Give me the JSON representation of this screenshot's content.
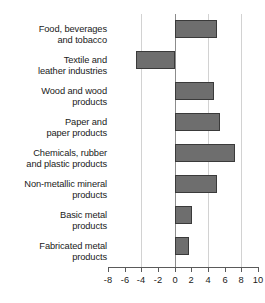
{
  "chart_data": {
    "type": "bar",
    "orientation": "horizontal",
    "title": "",
    "subtitle": "",
    "xlabel": "",
    "ylabel": "",
    "categories": [
      "Food, beverages and tobacco",
      "Textile and leather industries",
      "Wood and wood products",
      "Paper and paper products",
      "Chemicals, rubber and plastic products",
      "Non-metallic mineral products",
      "Basic metal products",
      "Fabricated metal products"
    ],
    "values": [
      5.1,
      -4.7,
      4.7,
      5.5,
      7.2,
      5.1,
      2.1,
      1.7
    ],
    "xlim": [
      -8,
      10
    ],
    "xticks": [
      -8,
      -6,
      -4,
      -2,
      0,
      2,
      4,
      6,
      8,
      10
    ],
    "xtick_labels": [
      "-8",
      "-6",
      "-4",
      "-2",
      "0",
      "2",
      "4",
      "6",
      "8",
      "10"
    ],
    "gridlines_at": [
      -4,
      0,
      4,
      8
    ],
    "grid": true,
    "legend": false,
    "legend_position": "none",
    "bar_color": "#6e6e6e",
    "bar_border_color": "#3a3a3a",
    "gridline_color": "#d2d2d2",
    "zeroline_color": "#8c8c8c",
    "axis_color": "#5a5a5a",
    "text_color": "#1a1a1a",
    "background": "#ffffff"
  },
  "labels": {
    "l0_line1": "Food, beverages",
    "l0_line2": "and tobacco",
    "l1_line1": "Textile and",
    "l1_line2": "leather industries",
    "l2_line1": "Wood and wood",
    "l2_line2": "products",
    "l3_line1": "Paper and",
    "l3_line2": "paper products",
    "l4_line1": "Chemicals, rubber",
    "l4_line2": "and plastic products",
    "l5_line1": "Non-metallic mineral",
    "l5_line2": "products",
    "l6_line1": "Basic metal",
    "l6_line2": "products",
    "l7_line1": "Fabricated metal",
    "l7_line2": "products"
  }
}
